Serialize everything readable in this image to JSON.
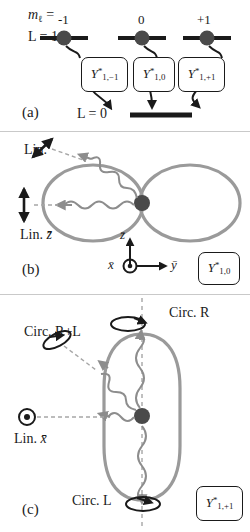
{
  "figure": {
    "caption_panels": [
      "(a)",
      "(b)",
      "(c)"
    ],
    "colors": {
      "orbital_gray": "#9a9a9a",
      "photon_gray": "#8d8d8d",
      "level_black": "#1a1a1a",
      "dot_dark": "#4a4a4a",
      "dashed_gray": "#a6a6a6",
      "divider": "#c9c9c9"
    }
  },
  "panel_a": {
    "letter": "(a)",
    "row_label_m": "m",
    "row_label_m_sub": "ℓ",
    "row_label_m_eq": " =",
    "row_label_L": "L = 1",
    "m_values": [
      "-1",
      "0",
      "+1"
    ],
    "lower_level_label": "L = 0",
    "harmonics": [
      {
        "base": "Y",
        "star": "*",
        "sub": "1,−1"
      },
      {
        "base": "Y",
        "star": "*",
        "sub": "1,0"
      },
      {
        "base": "Y",
        "star": "*",
        "sub": "1,+1"
      }
    ]
  },
  "panel_b": {
    "letter": "(b)",
    "polarization_diagonal": "Lin.",
    "polarization_vertical": "Lin. z̄",
    "axes": {
      "z": "z̄",
      "y": "ȳ",
      "x": "x̄"
    },
    "harmonic": {
      "base": "Y",
      "star": "*",
      "sub": "1,0"
    },
    "shape": "dumbbell"
  },
  "panel_c": {
    "letter": "(c)",
    "circ_top": "Circ. R",
    "circ_side": "Circ. R+L",
    "circ_bottom": "Circ. L",
    "lin_x": "Lin. x̄",
    "harmonic": {
      "base": "Y",
      "star": "*",
      "sub": "1,+1"
    },
    "shape": "torus"
  }
}
